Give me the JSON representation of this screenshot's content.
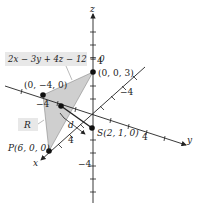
{
  "diagram": {
    "equation": "2x − 3y + 4z − 12 = 0",
    "axes": {
      "x_label": "x",
      "y_label": "y",
      "z_label": "z",
      "ticks": {
        "z_pos": "4",
        "z_neg": "−4",
        "y_pos": "4",
        "y_neg": "−4",
        "x_pos": "4",
        "x_neg": "−4"
      }
    },
    "points": {
      "z_intercept": "(0, 0, 3)",
      "y_intercept": "(0, −4, 0)",
      "x_intercept": "P(6, 0, 0)",
      "s_point": "S(2, 1, 0)",
      "region_label": "R",
      "distance_label": "d"
    },
    "colors": {
      "plane_fill": "#cfcfcf",
      "axis": "#222222",
      "label_box": "#e8e8e8"
    }
  }
}
